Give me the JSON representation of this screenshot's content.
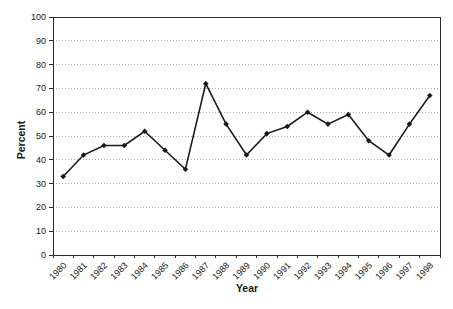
{
  "chart_data": {
    "type": "line",
    "title": "",
    "xlabel": "Year",
    "ylabel": "Percent",
    "categories": [
      "1980",
      "1981",
      "1982",
      "1983",
      "1984",
      "1985",
      "1986",
      "1987",
      "1988",
      "1989",
      "1990",
      "1991",
      "1992",
      "1993",
      "1994",
      "1995",
      "1996",
      "1997",
      "1998"
    ],
    "series": [
      {
        "name": "Percent",
        "values": [
          33,
          42,
          46,
          46,
          52,
          44,
          36,
          72,
          55,
          42,
          51,
          54,
          60,
          55,
          59,
          48,
          42,
          55,
          67
        ]
      }
    ],
    "ylim": [
      0,
      100
    ],
    "ytick_step": 10,
    "grid": "horizontal-dotted",
    "legend_position": "none",
    "marker": "diamond",
    "colors": {
      "line": "#1a1a1a",
      "marker": "#1a1a1a",
      "grid": "#a8a8a8",
      "axis": "#2b2b2b",
      "text": "#1a1a1a",
      "background": "#ffffff"
    }
  }
}
